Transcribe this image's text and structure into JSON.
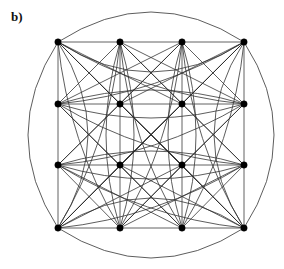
{
  "figure": {
    "panel_label": "b)",
    "caption_text": "b)",
    "type": "graph-drawing",
    "background_color": "#ffffff",
    "edge_color": "#2b2b2b",
    "node_color": "#000000",
    "node_radius": 3.2,
    "width": 284,
    "height": 269
  },
  "chart_data": {
    "type": "scatter",
    "title": "b)",
    "xlabel": "",
    "ylabel": "",
    "grid_rows": 4,
    "grid_cols": 4,
    "node_count": 16,
    "x": [
      58,
      120,
      182,
      244,
      58,
      120,
      182,
      244,
      58,
      120,
      182,
      244,
      58,
      120,
      182,
      244
    ],
    "y": [
      42,
      42,
      42,
      42,
      104,
      104,
      104,
      104,
      165,
      165,
      165,
      165,
      228,
      228,
      228,
      228
    ],
    "node_ids": [
      0,
      1,
      2,
      3,
      4,
      5,
      6,
      7,
      8,
      9,
      10,
      11,
      12,
      13,
      14,
      15
    ],
    "nodes": [
      {
        "id": 0,
        "row": 0,
        "col": 0,
        "x": 58,
        "y": 42
      },
      {
        "id": 1,
        "row": 0,
        "col": 1,
        "x": 120,
        "y": 42
      },
      {
        "id": 2,
        "row": 0,
        "col": 2,
        "x": 182,
        "y": 42
      },
      {
        "id": 3,
        "row": 0,
        "col": 3,
        "x": 244,
        "y": 42
      },
      {
        "id": 4,
        "row": 1,
        "col": 0,
        "x": 58,
        "y": 104
      },
      {
        "id": 5,
        "row": 1,
        "col": 1,
        "x": 120,
        "y": 104
      },
      {
        "id": 6,
        "row": 1,
        "col": 2,
        "x": 182,
        "y": 104
      },
      {
        "id": 7,
        "row": 1,
        "col": 3,
        "x": 244,
        "y": 104
      },
      {
        "id": 8,
        "row": 2,
        "col": 0,
        "x": 58,
        "y": 165
      },
      {
        "id": 9,
        "row": 2,
        "col": 1,
        "x": 120,
        "y": 165
      },
      {
        "id": 10,
        "row": 2,
        "col": 2,
        "x": 182,
        "y": 165
      },
      {
        "id": 11,
        "row": 2,
        "col": 3,
        "x": 244,
        "y": 165
      },
      {
        "id": 12,
        "row": 3,
        "col": 0,
        "x": 58,
        "y": 228
      },
      {
        "id": 13,
        "row": 3,
        "col": 1,
        "x": 120,
        "y": 228
      },
      {
        "id": 14,
        "row": 3,
        "col": 2,
        "x": 182,
        "y": 228
      },
      {
        "id": 15,
        "row": 3,
        "col": 3,
        "x": 244,
        "y": 228
      }
    ],
    "edges_straight": [
      [
        0,
        1
      ],
      [
        1,
        2
      ],
      [
        2,
        3
      ],
      [
        4,
        5
      ],
      [
        5,
        6
      ],
      [
        6,
        7
      ],
      [
        8,
        9
      ],
      [
        9,
        10
      ],
      [
        10,
        11
      ],
      [
        12,
        13
      ],
      [
        13,
        14
      ],
      [
        14,
        15
      ],
      [
        0,
        4
      ],
      [
        4,
        8
      ],
      [
        8,
        12
      ],
      [
        1,
        5
      ],
      [
        5,
        9
      ],
      [
        9,
        13
      ],
      [
        2,
        6
      ],
      [
        6,
        10
      ],
      [
        10,
        14
      ],
      [
        3,
        7
      ],
      [
        7,
        11
      ],
      [
        11,
        15
      ]
    ],
    "edges_diagonal": [
      [
        0,
        5
      ],
      [
        1,
        4
      ],
      [
        1,
        6
      ],
      [
        2,
        5
      ],
      [
        2,
        7
      ],
      [
        3,
        6
      ],
      [
        4,
        9
      ],
      [
        5,
        8
      ],
      [
        5,
        10
      ],
      [
        6,
        9
      ],
      [
        6,
        11
      ],
      [
        7,
        10
      ],
      [
        8,
        13
      ],
      [
        9,
        12
      ],
      [
        9,
        14
      ],
      [
        10,
        13
      ],
      [
        10,
        15
      ],
      [
        11,
        14
      ],
      [
        0,
        10
      ],
      [
        1,
        11
      ],
      [
        4,
        14
      ],
      [
        5,
        15
      ],
      [
        2,
        8
      ],
      [
        3,
        9
      ],
      [
        6,
        12
      ],
      [
        7,
        13
      ],
      [
        0,
        15
      ],
      [
        3,
        12
      ],
      [
        0,
        6
      ],
      [
        1,
        7
      ],
      [
        8,
        14
      ],
      [
        9,
        15
      ],
      [
        2,
        4
      ],
      [
        3,
        5
      ],
      [
        10,
        12
      ],
      [
        11,
        13
      ]
    ],
    "edges_wrap_horizontal": [
      [
        0,
        3
      ],
      [
        4,
        7
      ],
      [
        8,
        11
      ],
      [
        12,
        15
      ]
    ],
    "edges_wrap_vertical": [
      [
        0,
        12
      ],
      [
        1,
        13
      ],
      [
        2,
        14
      ],
      [
        3,
        15
      ]
    ],
    "edges_wrap_diagonal": [
      [
        0,
        13
      ],
      [
        1,
        12
      ],
      [
        1,
        14
      ],
      [
        2,
        13
      ],
      [
        2,
        15
      ],
      [
        3,
        14
      ],
      [
        0,
        7
      ],
      [
        3,
        4
      ],
      [
        4,
        11
      ],
      [
        7,
        8
      ],
      [
        8,
        15
      ],
      [
        11,
        12
      ]
    ],
    "legend": [],
    "annotations": [
      {
        "text": "b)",
        "x": 14,
        "y": 22
      }
    ]
  }
}
